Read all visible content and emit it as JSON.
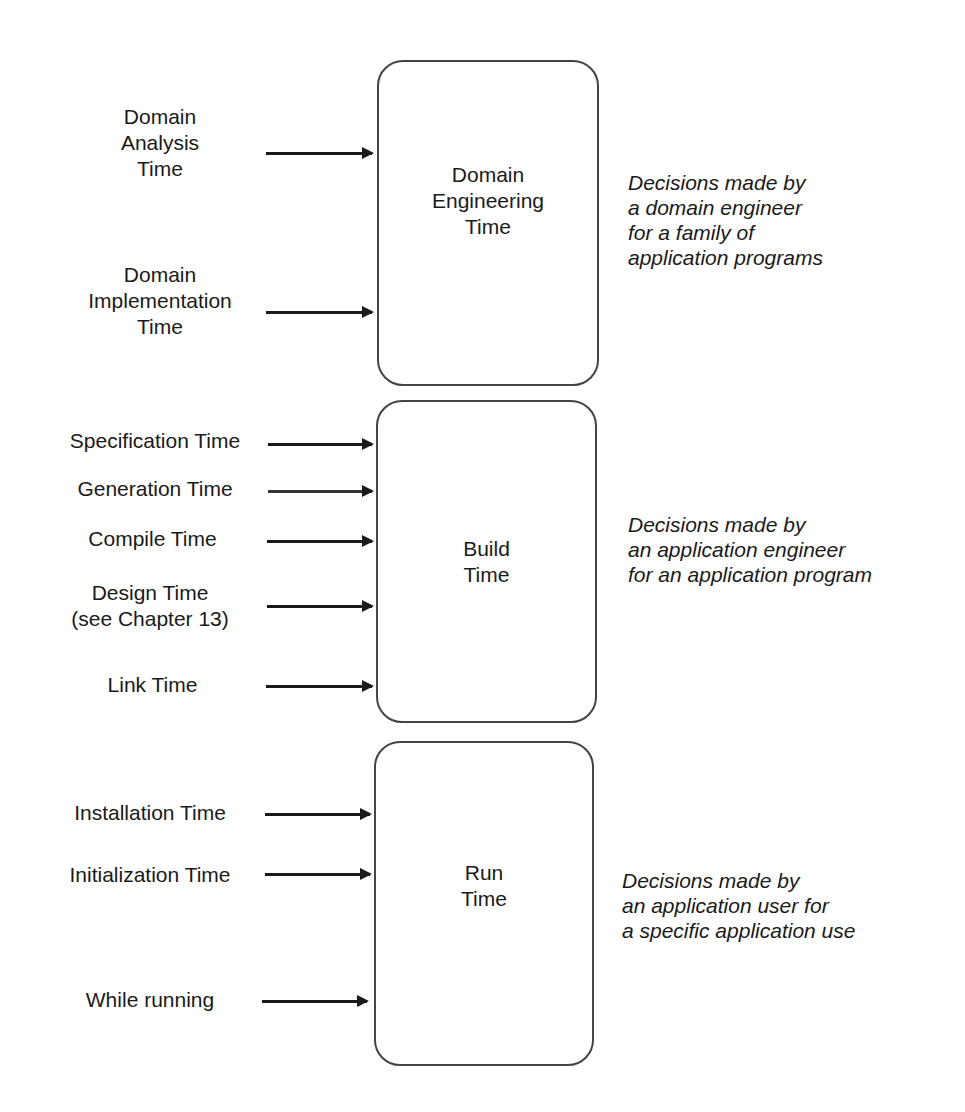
{
  "stages": [
    {
      "title": [
        "Domain",
        "Engineering",
        "Time"
      ],
      "note": [
        "Decisions made by",
        "a domain engineer",
        "for a family of",
        "application programs"
      ],
      "inputs": [
        {
          "label": [
            "Domain",
            "Analysis",
            "Time"
          ]
        },
        {
          "label": [
            "Domain",
            "Implementation",
            "Time"
          ]
        }
      ]
    },
    {
      "title": [
        "Build",
        "Time"
      ],
      "note": [
        "Decisions made by",
        "an application engineer",
        "for an application program"
      ],
      "inputs": [
        {
          "label": [
            "Specification Time"
          ]
        },
        {
          "label": [
            "Generation Time"
          ]
        },
        {
          "label": [
            "Compile Time"
          ]
        },
        {
          "label": [
            "Design Time",
            "(see Chapter 13)"
          ]
        },
        {
          "label": [
            "Link Time"
          ]
        }
      ]
    },
    {
      "title": [
        "Run",
        "Time"
      ],
      "note": [
        "Decisions made by",
        "an application user for",
        "a specific application use"
      ],
      "inputs": [
        {
          "label": [
            "Installation Time"
          ]
        },
        {
          "label": [
            "Initialization Time"
          ]
        },
        {
          "label": [
            "While running"
          ]
        }
      ]
    }
  ]
}
